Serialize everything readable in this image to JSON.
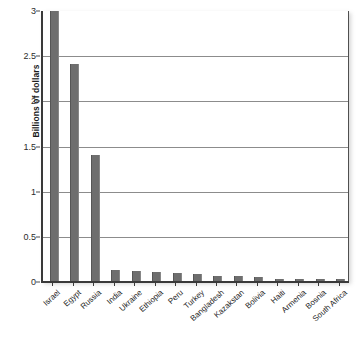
{
  "chart_data": {
    "type": "bar",
    "title": "",
    "xlabel": "",
    "ylabel": "Billions of dollars",
    "ylim": [
      0,
      3
    ],
    "yticks": [
      "0",
      "0.5",
      "1",
      "1.5",
      "2",
      "2.5",
      "3"
    ],
    "ytick_values": [
      0,
      0.5,
      1,
      1.5,
      2,
      2.5,
      3
    ],
    "grid": true,
    "legend": "none",
    "bar_color": "#6e6e6e",
    "clipped_bars": [
      "Israel"
    ],
    "categories": [
      "Israel",
      "Egypt",
      "Russia",
      "India",
      "Ukraine",
      "Ethiopia",
      "Peru",
      "Turkey",
      "Bangladesh",
      "Kazakstan",
      "Bolivia",
      "Haiti",
      "Armenia",
      "Bosnia",
      "South Africa"
    ],
    "values": [
      3.0,
      2.4,
      1.4,
      0.12,
      0.11,
      0.1,
      0.09,
      0.08,
      0.06,
      0.05,
      0.04,
      0.025,
      0.025,
      0.02,
      0.02
    ]
  }
}
